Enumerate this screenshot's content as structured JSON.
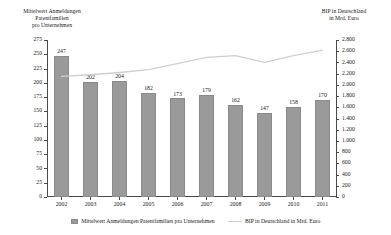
{
  "axes": {
    "left_title": "Mittelwert Anmeldungen\nPatentfamilien\npro Unternehmen",
    "right_title": "BIP in Deutschland\nin Mrd. Euro"
  },
  "legend": {
    "bar_label": "Mittelwert Anmeldungen Patentfamilien pro Unternehmen",
    "line_label": "BIP in Deutschland in Mrd. Euro"
  },
  "colors": {
    "bar": "#9a9a9a",
    "line": "#cfcfcf",
    "axis": "#4a4a4a",
    "text": "#1a1a1a",
    "background": "#ffffff"
  },
  "chart_data": {
    "type": "bar",
    "title": "",
    "subtitle": "",
    "xlabel": "",
    "ylabel": "Mittelwert Anmeldungen Patentfamilien pro Unternehmen",
    "y2label": "BIP in Deutschland in Mrd. Euro",
    "categories": [
      "2002",
      "2003",
      "2004",
      "2005",
      "2006",
      "2007",
      "2008",
      "2009",
      "2010",
      "2011"
    ],
    "ylim": [
      0,
      275
    ],
    "y2lim": [
      0,
      2800
    ],
    "yticks": [
      0,
      25,
      50,
      75,
      100,
      125,
      150,
      175,
      200,
      225,
      250,
      275
    ],
    "ytick_labels": [
      "0",
      "25",
      "50",
      "75",
      "100",
      "125",
      "150",
      "175",
      "200",
      "225",
      "250",
      "275"
    ],
    "y2ticks": [
      0,
      200,
      400,
      600,
      800,
      1000,
      1200,
      1400,
      1600,
      1800,
      2000,
      2200,
      2400,
      2600,
      2800
    ],
    "y2tick_labels": [
      "0",
      "200",
      "400",
      "600",
      "800",
      "1.000",
      "1.200",
      "1.400",
      "1.600",
      "1.800",
      "2.000",
      "2.200",
      "2.400",
      "2.600",
      "2.800"
    ],
    "grid": false,
    "legend_position": "bottom",
    "series": [
      {
        "name": "Mittelwert Anmeldungen Patentfamilien pro Unternehmen",
        "type": "bar",
        "axis": "left",
        "values": [
          247,
          202,
          204,
          182,
          173,
          179,
          162,
          147,
          158,
          170
        ],
        "labels": [
          "247",
          "202",
          "204",
          "182",
          "173",
          "179",
          "162",
          "147",
          "158",
          "170"
        ]
      },
      {
        "name": "BIP in Deutschland in Mrd. Euro",
        "type": "line",
        "axis": "right",
        "values": [
          2150,
          2180,
          2220,
          2270,
          2380,
          2490,
          2520,
          2400,
          2520,
          2620
        ]
      }
    ]
  }
}
